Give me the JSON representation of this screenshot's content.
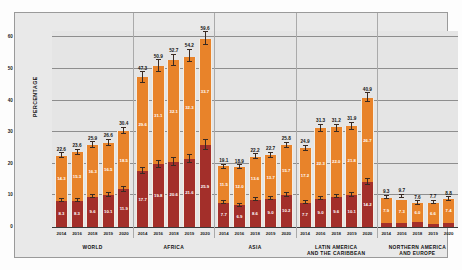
{
  "chart_data": {
    "type": "bar",
    "subtype": "stacked-bar-grouped-with-error-bars",
    "title": "",
    "xlabel": "",
    "ylabel": "PERCENTAGE",
    "ylim": [
      0,
      62
    ],
    "yticks": [
      0,
      10,
      20,
      30,
      40,
      50,
      60
    ],
    "grid": true,
    "legend_position": "none",
    "series": [
      {
        "name": "severe-food-insecurity",
        "color": "#a32f2a"
      },
      {
        "name": "moderate-food-insecurity",
        "color": "#e8832a"
      }
    ],
    "groups": [
      {
        "label": "WORLD",
        "label_lines": [
          "WORLD"
        ],
        "years": [
          "2014",
          "2016",
          "2018",
          "2019",
          "2020"
        ],
        "totals": [
          22.6,
          23.6,
          25.9,
          26.6,
          30.4
        ],
        "severe": [
          8.3,
          8.3,
          9.6,
          10.1,
          11.9
        ],
        "moderate": [
          14.3,
          15.3,
          16.3,
          16.5,
          18.5
        ]
      },
      {
        "label": "AFRICA",
        "label_lines": [
          "AFRICA"
        ],
        "years": [
          "2014",
          "2016",
          "2018",
          "2019",
          "2020"
        ],
        "totals": [
          47.3,
          50.9,
          52.7,
          54.2,
          59.6
        ],
        "severe": [
          17.7,
          19.8,
          20.6,
          21.6,
          25.9
        ],
        "moderate": [
          29.6,
          31.1,
          32.1,
          32.3,
          33.7
        ]
      },
      {
        "label": "ASIA",
        "label_lines": [
          "ASIA"
        ],
        "years": [
          "2014",
          "2016",
          "2018",
          "2019",
          "2020"
        ],
        "totals": [
          19.1,
          18.9,
          22.2,
          22.7,
          25.8
        ],
        "severe": [
          7.7,
          6.9,
          8.6,
          9.0,
          10.2
        ],
        "moderate": [
          11.5,
          12.0,
          13.6,
          13.7,
          15.7
        ]
      },
      {
        "label": "LATIN AMERICA AND THE CARIBBEAN",
        "label_lines": [
          "LATIN AMERICA",
          "AND THE CARIBBEAN"
        ],
        "years": [
          "2014",
          "2016",
          "2018",
          "2019",
          "2020"
        ],
        "totals": [
          24.9,
          31.3,
          31.2,
          31.9,
          40.9
        ],
        "severe": [
          7.7,
          9.0,
          9.6,
          10.1,
          14.2
        ],
        "moderate": [
          17.2,
          22.3,
          22.0,
          21.8,
          26.7
        ]
      },
      {
        "label": "NORTHERN AMERICA AND EUROPE",
        "label_lines": [
          "NORTHERN AMERICA",
          "AND EUROPE"
        ],
        "years": [
          "2014",
          "2016",
          "2018",
          "2019",
          "2020"
        ],
        "totals": [
          9.3,
          9.7,
          7.6,
          7.7,
          8.8
        ],
        "severe": [
          1.4,
          1.4,
          1.6,
          1.1,
          1.4
        ],
        "moderate": [
          7.9,
          7.3,
          6.0,
          6.6,
          7.4
        ]
      }
    ]
  },
  "colors": {
    "moderate": "#e8832a",
    "severe": "#a32f2a",
    "plot_background": "#e5e5e5",
    "grid": "#8e8e8e",
    "axis": "#3a3a3a",
    "page_background": "#ffffff"
  }
}
